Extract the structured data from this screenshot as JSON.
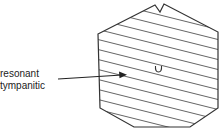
{
  "diagram": {
    "labels": [
      "resonant",
      "tympanitic"
    ],
    "region_marker": "U",
    "colors": {
      "outline": "#333333",
      "hatch": "#555555",
      "text": "#222222",
      "background": "#ffffff"
    }
  }
}
